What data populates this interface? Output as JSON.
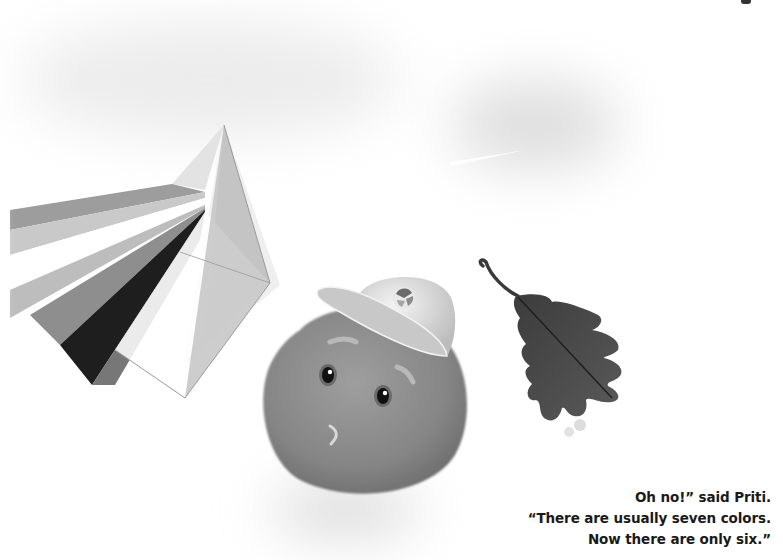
{
  "page": {
    "style": "grayscale storybook illustration",
    "colors": {
      "background": "#ffffff",
      "text": "#1a1a1a",
      "prism_face_light": "#e6e6e6",
      "prism_face_mid": "#bdbdbd",
      "blob_body": "#8a8a8a",
      "leaf": "#4a4a4a"
    }
  },
  "illustration": {
    "prism": {
      "label": "prism-with-light-bands",
      "band_count": 6
    },
    "character": {
      "name": "Priti",
      "description": "round blob character wearing a cap"
    },
    "leaf": {
      "description": "dark oak leaf"
    },
    "cloud": {
      "description": "faint blurred cloud with light streak"
    }
  },
  "caption": {
    "lines": [
      "Oh no!” said Priti.",
      "“There are usually seven colors.",
      "Now there are only six.”"
    ]
  }
}
